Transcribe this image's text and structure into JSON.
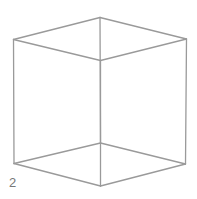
{
  "figure": {
    "label": "2",
    "type": "wireframe cube",
    "stroke_color": "#999999",
    "vertices": {
      "left_top": [
        13.5,
        39.5
      ],
      "back_top": [
        100,
        17.5
      ],
      "right_top": [
        186.5,
        39
      ],
      "front_top": [
        100.5,
        60.5
      ],
      "left_bottom": [
        14,
        163.5
      ],
      "back_bottom": [
        100.5,
        143
      ],
      "right_bottom": [
        185.5,
        164
      ],
      "front_bottom": [
        100.5,
        186
      ]
    }
  }
}
